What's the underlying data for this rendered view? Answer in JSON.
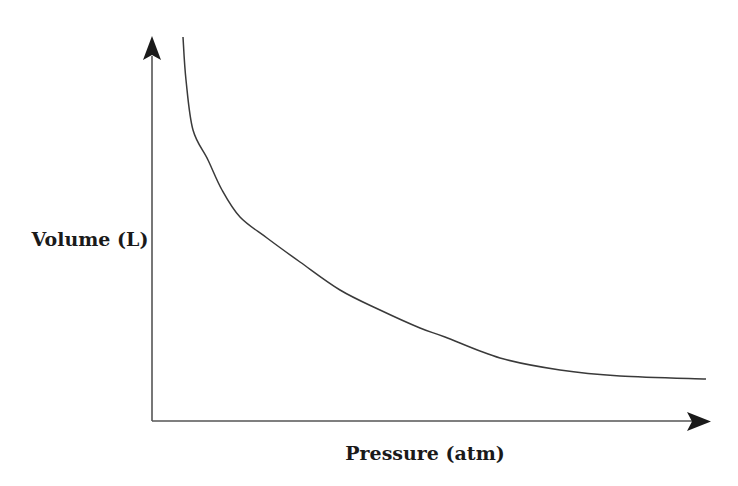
{
  "chart_data": {
    "type": "line",
    "title": "",
    "xlabel": "Pressure (atm)",
    "ylabel": "Volume (L)",
    "grid": false,
    "legend": null,
    "ticks": {
      "x": [],
      "y": []
    },
    "series": [
      {
        "name": "V vs P",
        "relationship": "inverse (V ∝ 1/P)",
        "points_px": [
          [
            183,
            37
          ],
          [
            186,
            80
          ],
          [
            193,
            130
          ],
          [
            208,
            160
          ],
          [
            222,
            190
          ],
          [
            240,
            217
          ],
          [
            267,
            238
          ],
          [
            300,
            262
          ],
          [
            340,
            290
          ],
          [
            380,
            310
          ],
          [
            420,
            328
          ],
          [
            445,
            337
          ],
          [
            500,
            358
          ],
          [
            560,
            370
          ],
          [
            620,
            376
          ],
          [
            706,
            379
          ]
        ]
      }
    ],
    "axes": {
      "origin_px": [
        152,
        421
      ],
      "x_end_px": [
        710,
        422
      ],
      "y_end_px": [
        152,
        36
      ]
    },
    "colors": {
      "axis": "#555555",
      "curve": "#3a3a3a",
      "arrowhead": "#1a1a1a",
      "label": "#1a1a1a"
    }
  },
  "labels": {
    "x_axis": "Pressure (atm)",
    "y_axis": "Volume (L)"
  }
}
